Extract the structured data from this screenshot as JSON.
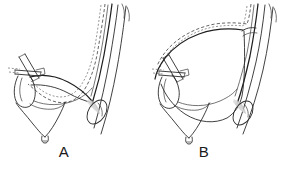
{
  "figure": {
    "type": "anatomical-line-drawing",
    "background_color": "#ffffff",
    "ink_color": "#2b2b2b",
    "panel_count": 2,
    "caption_labels": [
      "A",
      "B"
    ]
  },
  "panels": [
    {
      "id": "A",
      "label": "A",
      "label_x": 64,
      "label_y": 158,
      "description": "Short low-lying cystic duct joining the common bile duct",
      "parts": [
        {
          "name": "common-bile-duct",
          "kind": "vertical-duct",
          "shading": "none"
        },
        {
          "name": "cystic-duct",
          "kind": "curved-duct",
          "shading": "none"
        },
        {
          "name": "gallbladder-body",
          "kind": "sac",
          "shading": "none"
        },
        {
          "name": "gallbladder-infundibulum",
          "kind": "sac",
          "shading": "none"
        },
        {
          "name": "surgical-clip",
          "kind": "clip",
          "shading": "none"
        },
        {
          "name": "catheter-path",
          "kind": "dashed-line",
          "shading": "none"
        },
        {
          "name": "duct-junction-shading",
          "kind": "shaded-wedge",
          "shading": "grey"
        },
        {
          "name": "adjacent-vessel-loop",
          "kind": "ellipse",
          "shading": "none"
        }
      ]
    },
    {
      "id": "B",
      "label": "B",
      "label_x": 204,
      "label_y": 158,
      "description": "Long looping cystic duct with high insertion into the common bile duct",
      "parts": [
        {
          "name": "common-bile-duct",
          "kind": "vertical-duct",
          "shading": "none"
        },
        {
          "name": "cystic-duct",
          "kind": "curved-duct",
          "shading": "none"
        },
        {
          "name": "gallbladder-body",
          "kind": "sac",
          "shading": "none"
        },
        {
          "name": "gallbladder-infundibulum",
          "kind": "sac",
          "shading": "none"
        },
        {
          "name": "surgical-clip",
          "kind": "clip",
          "shading": "none"
        },
        {
          "name": "catheter-path",
          "kind": "dashed-line",
          "shading": "none"
        },
        {
          "name": "duct-junction-shading",
          "kind": "shaded-wedge",
          "shading": "grey"
        },
        {
          "name": "adjacent-vessel-loop",
          "kind": "ellipse",
          "shading": "none"
        }
      ]
    }
  ]
}
